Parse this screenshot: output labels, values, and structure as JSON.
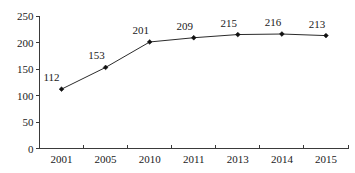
{
  "chart_data": {
    "type": "line",
    "title": "",
    "subtitle": "",
    "xlabel": "",
    "ylabel": "",
    "categories": [
      "2001",
      "2005",
      "2010",
      "2011",
      "2013",
      "2014",
      "2015"
    ],
    "values": [
      112,
      153,
      201,
      209,
      215,
      216,
      213
    ],
    "point_labels": [
      "112",
      "153",
      "201",
      "209",
      "215",
      "216",
      "213"
    ],
    "ylim": [
      0,
      250
    ],
    "ytick_values": [
      0,
      50,
      100,
      150,
      200,
      250
    ],
    "ytick_labels": [
      "0",
      "50",
      "100",
      "150",
      "200",
      "250"
    ],
    "grid": false,
    "legend": null,
    "series": [
      {
        "name": "",
        "values": [
          112,
          153,
          201,
          209,
          215,
          216,
          213
        ],
        "marker": "diamond",
        "line_color": "#2b2b2b",
        "marker_color": "#111111"
      }
    ],
    "colors": {
      "background": "#ffffff",
      "axis": "#3a3a3a",
      "text": "#1a1a1a",
      "line": "#2b2b2b",
      "marker": "#111111"
    }
  }
}
